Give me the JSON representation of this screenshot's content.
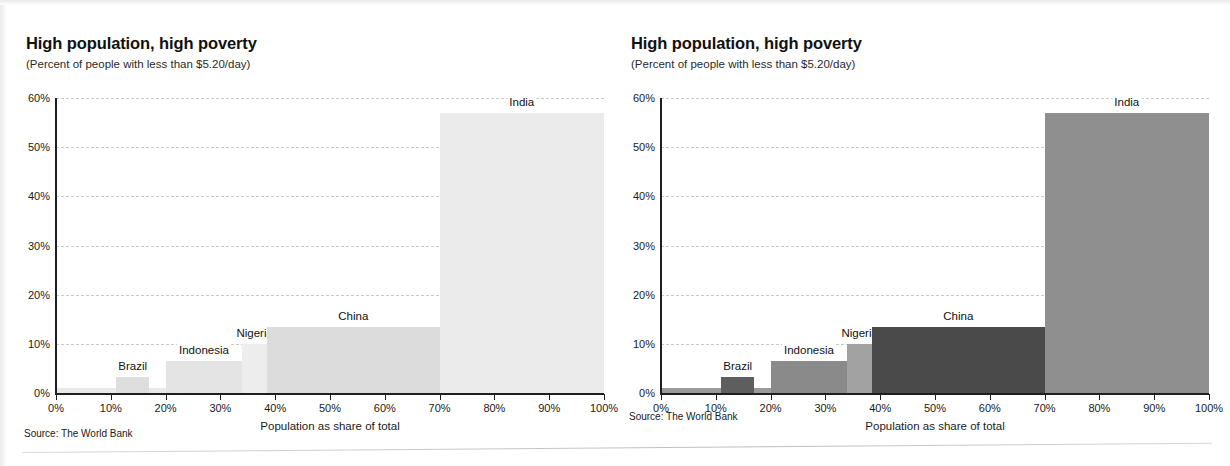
{
  "panels": [
    {
      "id": "left",
      "title": "High population, high poverty",
      "subtitle": "(Percent of people with less than $5.20/day)",
      "source": "Source: The World Bank",
      "style": "faded"
    },
    {
      "id": "right",
      "title": "High population, high poverty",
      "subtitle": "(Percent of people with less than $5.20/day)",
      "source": "Source: The World Bank",
      "style": "full-contrast"
    }
  ],
  "chart_data": {
    "type": "bar",
    "variant": "marimekko",
    "title": "High population, high poverty",
    "subtitle": "(Percent of people with less than $5.20/day)",
    "xlabel": "Population as share of total",
    "ylabel": "",
    "xlim": [
      0,
      100
    ],
    "ylim": [
      0,
      60
    ],
    "grid": true,
    "legend": "none",
    "source": "Source: The World Bank",
    "x_ticks": [
      "0%",
      "10%",
      "20%",
      "30%",
      "40%",
      "50%",
      "60%",
      "70%",
      "80%",
      "90%",
      "100%"
    ],
    "x_tick_values": [
      0,
      10,
      20,
      30,
      40,
      50,
      60,
      70,
      80,
      90,
      100
    ],
    "y_ticks": [
      "0%",
      "10%",
      "20%",
      "30%",
      "40%",
      "50%",
      "60%"
    ],
    "y_tick_values": [
      0,
      10,
      20,
      30,
      40,
      50,
      60
    ],
    "note": "Bar width = share of total population; bar height = percent of people living on less than $5.20/day",
    "bars": [
      {
        "label": "",
        "x_start": 0,
        "x_end": 11,
        "value": 1.0,
        "labeled": false,
        "color_full": "#9a9a9a",
        "color_faded": "#e9e9e9"
      },
      {
        "label": "Brazil",
        "x_start": 11,
        "x_end": 17,
        "value": 3.2,
        "labeled": true,
        "color_full": "#5e5e5e",
        "color_faded": "#dedede"
      },
      {
        "label": "",
        "x_start": 17,
        "x_end": 20,
        "value": 1.0,
        "labeled": false,
        "color_full": "#9a9a9a",
        "color_faded": "#e9e9e9"
      },
      {
        "label": "Indonesia",
        "x_start": 20,
        "x_end": 34,
        "value": 6.5,
        "labeled": true,
        "color_full": "#8a8a8a",
        "color_faded": "#e4e4e4"
      },
      {
        "label": "Nigeria",
        "x_start": 34,
        "x_end": 38.5,
        "value": 10.0,
        "labeled": true,
        "color_full": "#a2a2a2",
        "color_faded": "#ededed"
      },
      {
        "label": "China",
        "x_start": 38.5,
        "x_end": 70,
        "value": 13.4,
        "labeled": true,
        "color_full": "#4a4a4a",
        "color_faded": "#dcdcdc"
      },
      {
        "label": "India",
        "x_start": 70,
        "x_end": 100,
        "value": 57.0,
        "labeled": true,
        "color_full": "#8f8f8f",
        "color_faded": "#ebebeb"
      }
    ]
  }
}
